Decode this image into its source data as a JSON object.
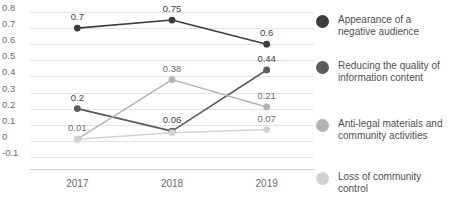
{
  "chart_data": {
    "type": "line",
    "title": "",
    "subtitle": "",
    "xlabel": "",
    "ylabel": "",
    "categories": [
      "2017",
      "2018",
      "2019"
    ],
    "ylim": [
      -0.1,
      0.8
    ],
    "ytick_labels": [
      "0.8",
      "0.7",
      "0.6",
      "0.5",
      "0.4",
      "0.3",
      "0.2",
      "0.1",
      "0",
      "-0.1"
    ],
    "ytick_values": [
      0.8,
      0.7,
      0.6,
      0.5,
      0.4,
      0.3,
      0.2,
      0.1,
      0,
      -0.1
    ],
    "grid": true,
    "legend_position": "right",
    "series": [
      {
        "name": "Appearance of a negative audience",
        "color": "#3d3d3d",
        "values": [
          0.7,
          0.75,
          0.6
        ],
        "labels": [
          "0.7",
          "0.75",
          "0.6"
        ]
      },
      {
        "name": "Reducing the quality of information content",
        "color": "#5c5c5c",
        "values": [
          0.2,
          0.06,
          0.44
        ],
        "labels": [
          "0.2",
          "0.06",
          "0.44"
        ]
      },
      {
        "name": "Anti-legal materials and community activities",
        "color": "#b3b3b3",
        "values": [
          0.01,
          0.38,
          0.21
        ],
        "labels": [
          "0.01",
          "0.38",
          "0.21"
        ]
      },
      {
        "name": "Loss of community control",
        "color": "#d2d2d2",
        "values": [
          0.01,
          0.05,
          0.07
        ],
        "labels": [
          "",
          "",
          "0.07"
        ]
      }
    ]
  },
  "legend": {
    "items": [
      {
        "label": "Appearance of a negative audience",
        "color": "#3d3d3d"
      },
      {
        "label": "Reducing the quality of information content",
        "color": "#5c5c5c"
      },
      {
        "label": "Anti-legal materials and community activities",
        "color": "#b3b3b3"
      },
      {
        "label": "Loss of community control",
        "color": "#d2d2d2"
      }
    ]
  }
}
